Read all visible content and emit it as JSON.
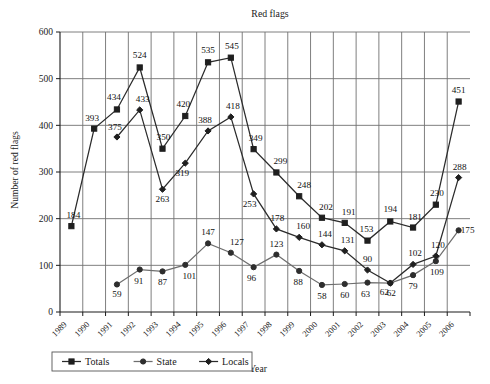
{
  "chart_data": {
    "type": "line",
    "title": "Red flags",
    "xlabel": "Year",
    "ylabel": "Number of red flags",
    "categories": [
      "1989",
      "1990",
      "1991",
      "1992",
      "1993",
      "1994",
      "1995",
      "1996",
      "1997",
      "1998",
      "1999",
      "2000",
      "2001",
      "2002",
      "2003",
      "2004",
      "2005",
      "2006"
    ],
    "ylim": [
      0,
      600
    ],
    "yticks": [
      0,
      100,
      200,
      300,
      400,
      500,
      600
    ],
    "grid": true,
    "legend_position": "bottom",
    "series": [
      {
        "name": "Totals",
        "marker": "square",
        "values": [
          184,
          393,
          434,
          524,
          350,
          420,
          535,
          545,
          349,
          299,
          248,
          202,
          191,
          153,
          194,
          181,
          230,
          451
        ]
      },
      {
        "name": "State",
        "marker": "circle",
        "values": [
          null,
          null,
          59,
          91,
          87,
          101,
          147,
          127,
          96,
          123,
          88,
          58,
          60,
          63,
          62,
          79,
          109,
          175
        ]
      },
      {
        "name": "Locals",
        "marker": "diamond",
        "values": [
          null,
          null,
          375,
          433,
          263,
          319,
          388,
          418,
          253,
          178,
          160,
          144,
          131,
          90,
          62,
          102,
          120,
          288
        ]
      }
    ]
  },
  "legend": {
    "items": [
      {
        "label": "Totals"
      },
      {
        "label": "State"
      },
      {
        "label": "Locals"
      }
    ]
  },
  "colors": {
    "totals": "#2b2b2b",
    "state": "#6e6e6e",
    "locals": "#2b2b2b",
    "grid": "#707070",
    "axis": "#1a1a1a",
    "background": "#ffffff"
  }
}
